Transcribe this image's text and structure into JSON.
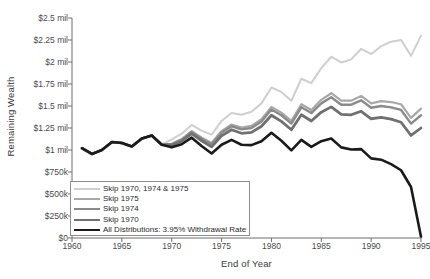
{
  "chart_data": {
    "type": "line",
    "title": "",
    "xlabel": "End of Year",
    "ylabel": "Remaining Wealth",
    "xlim": [
      1960,
      1995
    ],
    "ylim": [
      0,
      2500000
    ],
    "grid": false,
    "legend_position": "lower-left-inside",
    "x_ticks": [
      "1960",
      "1965",
      "1970",
      "1975",
      "1980",
      "1985",
      "1990",
      "1995"
    ],
    "x_tick_values": [
      1960,
      1965,
      1970,
      1975,
      1980,
      1985,
      1990,
      1995
    ],
    "y_ticks": [
      "$0",
      "$250k",
      "$500k",
      "$750k",
      "$1 mil",
      "$1.25 mil",
      "$1.5 mil",
      "$1.75 mil",
      "$2 mil",
      "$2.25 mil",
      "$2.5 mil"
    ],
    "y_tick_values": [
      0,
      250000,
      500000,
      750000,
      1000000,
      1250000,
      1500000,
      1750000,
      2000000,
      2250000,
      2500000
    ],
    "x": [
      1961,
      1962,
      1963,
      1964,
      1965,
      1966,
      1967,
      1968,
      1969,
      1970,
      1971,
      1972,
      1973,
      1974,
      1975,
      1976,
      1977,
      1978,
      1979,
      1980,
      1981,
      1982,
      1983,
      1984,
      1985,
      1986,
      1987,
      1988,
      1989,
      1990,
      1991,
      1992,
      1993,
      1994,
      1995
    ],
    "series": [
      {
        "name": "Skip 1970, 1974 & 1975",
        "color": "#cfcfcf",
        "width": 2.0,
        "values": [
          1020000,
          955000,
          1000000,
          1090000,
          1080000,
          1040000,
          1130000,
          1165000,
          1060000,
          1120000,
          1185000,
          1285000,
          1220000,
          1175000,
          1330000,
          1420000,
          1400000,
          1435000,
          1530000,
          1710000,
          1660000,
          1560000,
          1810000,
          1760000,
          1930000,
          2060000,
          1995000,
          2030000,
          2150000,
          2090000,
          2180000,
          2230000,
          2250000,
          2070000,
          2300000
        ]
      },
      {
        "name": "Skip 1975",
        "color": "#a8a8a8",
        "width": 2.2,
        "values": [
          1020000,
          955000,
          1000000,
          1090000,
          1080000,
          1040000,
          1130000,
          1165000,
          1060000,
          1070000,
          1125000,
          1215000,
          1140000,
          1080000,
          1215000,
          1290000,
          1255000,
          1275000,
          1350000,
          1490000,
          1425000,
          1330000,
          1520000,
          1455000,
          1570000,
          1645000,
          1560000,
          1560000,
          1615000,
          1530000,
          1555000,
          1545000,
          1520000,
          1365000,
          1470000
        ]
      },
      {
        "name": "Skip 1974",
        "color": "#8a8a8a",
        "width": 2.4,
        "values": [
          1020000,
          955000,
          1000000,
          1090000,
          1080000,
          1040000,
          1130000,
          1165000,
          1060000,
          1065000,
          1115000,
          1205000,
          1130000,
          1065000,
          1195000,
          1270000,
          1235000,
          1250000,
          1325000,
          1460000,
          1395000,
          1300000,
          1485000,
          1420000,
          1530000,
          1600000,
          1515000,
          1515000,
          1565000,
          1480000,
          1500000,
          1485000,
          1455000,
          1300000,
          1395000
        ]
      },
      {
        "name": "Skip 1970",
        "color": "#707070",
        "width": 2.8,
        "values": [
          1020000,
          955000,
          1000000,
          1090000,
          1080000,
          1040000,
          1130000,
          1165000,
          1060000,
          1055000,
          1100000,
          1185000,
          1105000,
          1035000,
          1160000,
          1230000,
          1190000,
          1200000,
          1270000,
          1395000,
          1325000,
          1230000,
          1400000,
          1330000,
          1430000,
          1490000,
          1405000,
          1400000,
          1440000,
          1355000,
          1370000,
          1350000,
          1315000,
          1165000,
          1250000
        ]
      },
      {
        "name": "All Distributions: 3.95% Withdrawal Rate",
        "color": "#1a1a1a",
        "width": 2.6,
        "values": [
          1020000,
          955000,
          1000000,
          1090000,
          1080000,
          1040000,
          1130000,
          1165000,
          1060000,
          1030000,
          1065000,
          1140000,
          1045000,
          960000,
          1060000,
          1115000,
          1060000,
          1055000,
          1100000,
          1195000,
          1105000,
          995000,
          1115000,
          1035000,
          1100000,
          1130000,
          1030000,
          1005000,
          1010000,
          905000,
          890000,
          840000,
          770000,
          580000,
          15000
        ]
      }
    ]
  }
}
